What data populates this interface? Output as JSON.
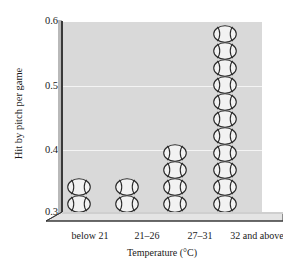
{
  "chart_data": {
    "type": "bar",
    "title": "",
    "subtitle": "",
    "xlabel": "Temperature (°C)",
    "ylabel": "Hit by pitch per game",
    "categories": [
      "below 21",
      "21–26",
      "27–31",
      "32 and above"
    ],
    "values": [
      0.34,
      0.35,
      0.4,
      0.58
    ],
    "icon_counts": [
      2,
      2,
      4,
      11
    ],
    "ylim": [
      0.3,
      0.6
    ],
    "yticks": [
      0.3,
      0.4,
      0.5,
      0.6
    ],
    "ytick_labels": [
      "0.3",
      "0.4",
      "0.5",
      "0.6"
    ],
    "grid": true,
    "gridline_color": "#f4f4f4",
    "legend": null,
    "legend_position": "none",
    "marker_icon": "baseball-icon",
    "style": "pictograph-3d",
    "plot_background": "#d9d9d9",
    "floor_color": "#e2e2e2",
    "axis_color": "#3a3a3a",
    "icon_fill": "#f2f2f2",
    "icon_stroke": "#2b2b2b"
  },
  "axis": {
    "y_title": "Hit by pitch per game",
    "x_title": "Temperature (°C)",
    "y_labels": [
      "0.6",
      "0.5",
      "0.4",
      "0.3"
    ],
    "x_labels": [
      "below 21",
      "21–26",
      "27–31",
      "32 and above"
    ]
  }
}
